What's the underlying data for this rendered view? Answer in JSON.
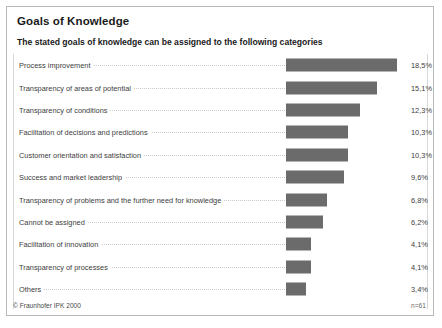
{
  "header": {
    "title": "Goals of Knowledge",
    "subtitle": "The stated goals of knowledge can be assigned to the following categories"
  },
  "footer": {
    "copyright": "© Fraunhofer IPK 2000",
    "sample_size": "n=61"
  },
  "colors": {
    "bar": "#6b6b6b",
    "border": "#b9b9b9",
    "text": "#3d3d3d",
    "leader": "#c8c8c8"
  },
  "chart_data": {
    "type": "bar",
    "orientation": "horizontal",
    "title": "Goals of Knowledge",
    "subtitle": "The stated goals of knowledge can be assigned to the following categories",
    "xlabel": "",
    "ylabel": "",
    "xlim": [
      0,
      20.6
    ],
    "grid": false,
    "legend": null,
    "value_suffix": "%",
    "decimal_separator": ",",
    "sample_size": 61,
    "categories": [
      "Process improvement",
      "Transparency of areas of potential",
      "Transparency of conditions",
      "Facilitation of decisions and predictions",
      "Customer orientation and satisfaction",
      "Success and market leadership",
      "Transparency of problems and the further need for knowledge",
      "Cannot be assigned",
      "Facilitation of innovation",
      "Transparency of processes",
      "Others"
    ],
    "values": [
      18.5,
      15.1,
      12.3,
      10.3,
      10.3,
      9.6,
      6.8,
      6.2,
      4.1,
      4.1,
      3.4
    ],
    "value_labels": [
      "18,5%",
      "15,1%",
      "12,3%",
      "10,3%",
      "10,3%",
      "9,6%",
      "6,8%",
      "6,2%",
      "4,1%",
      "4,1%",
      "3,4%"
    ]
  }
}
